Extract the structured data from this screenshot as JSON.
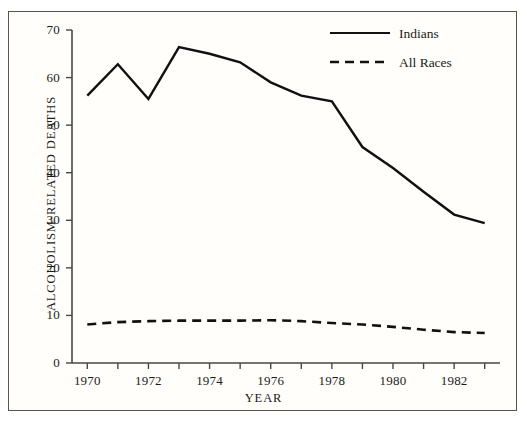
{
  "chart_data": {
    "type": "line",
    "title": "",
    "xlabel": "YEAR",
    "ylabel": "ALCOHOLISM-RELATED DEATHS",
    "x": [
      1970,
      1971,
      1972,
      1973,
      1974,
      1975,
      1976,
      1977,
      1978,
      1979,
      1980,
      1981,
      1982,
      1983
    ],
    "xlim": [
      1969.5,
      1983.5
    ],
    "ylim": [
      0,
      70
    ],
    "grid": false,
    "legend_position": "top-right",
    "xtick_values": [
      1970,
      1971,
      1972,
      1973,
      1974,
      1975,
      1976,
      1977,
      1978,
      1979,
      1980,
      1981,
      1982,
      1983
    ],
    "xtick_labels": [
      "1970",
      "",
      "1972",
      "",
      "1974",
      "",
      "1976",
      "",
      "1978",
      "",
      "1980",
      "",
      "1982",
      ""
    ],
    "ytick_values": [
      0,
      10,
      20,
      30,
      40,
      50,
      60,
      70
    ],
    "ytick_labels": [
      "0",
      "10",
      "20",
      "30",
      "40",
      "50",
      "60",
      "70"
    ],
    "series": [
      {
        "name": "Indians",
        "style": "solid",
        "color": "#111111",
        "values": [
          56.2,
          62.8,
          55.5,
          66.4,
          65.0,
          63.2,
          59.0,
          56.2,
          55.0,
          45.4,
          41.0,
          36.0,
          31.2,
          29.4
        ]
      },
      {
        "name": "All Races",
        "style": "dashed",
        "color": "#111111",
        "values": [
          8.1,
          8.6,
          8.8,
          8.9,
          8.9,
          8.9,
          9.0,
          8.8,
          8.4,
          8.1,
          7.6,
          7.0,
          6.5,
          6.3
        ]
      }
    ]
  },
  "legend": {
    "items": [
      {
        "label": "Indians",
        "style": "solid"
      },
      {
        "label": "All Races",
        "style": "dashed"
      }
    ]
  },
  "colors": {
    "ink": "#111111",
    "frame": "#56534f",
    "background": "#fffefb"
  }
}
